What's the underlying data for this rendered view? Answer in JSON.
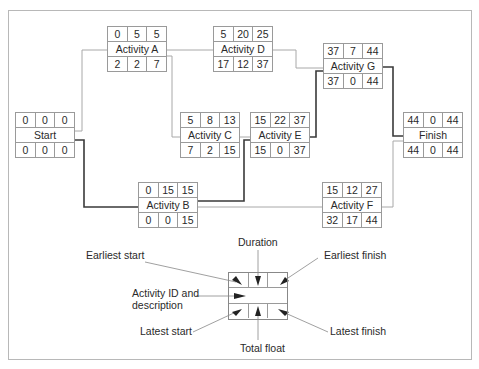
{
  "diagram": {
    "nodes": {
      "start": {
        "label": "Start",
        "es": "0",
        "dur": "0",
        "ef": "0",
        "ls": "0",
        "tf": "0",
        "lf": "0"
      },
      "activity_a": {
        "label": "Activity A",
        "es": "0",
        "dur": "5",
        "ef": "5",
        "ls": "2",
        "tf": "2",
        "lf": "7"
      },
      "activity_b": {
        "label": "Activity B",
        "es": "0",
        "dur": "15",
        "ef": "15",
        "ls": "0",
        "tf": "0",
        "lf": "15"
      },
      "activity_c": {
        "label": "Activity C",
        "es": "5",
        "dur": "8",
        "ef": "13",
        "ls": "7",
        "tf": "2",
        "lf": "15"
      },
      "activity_d": {
        "label": "Activity D",
        "es": "5",
        "dur": "20",
        "ef": "25",
        "ls": "17",
        "tf": "12",
        "lf": "37"
      },
      "activity_e": {
        "label": "Activity E",
        "es": "15",
        "dur": "22",
        "ef": "37",
        "ls": "15",
        "tf": "0",
        "lf": "37"
      },
      "activity_f": {
        "label": "Activity F",
        "es": "15",
        "dur": "12",
        "ef": "27",
        "ls": "32",
        "tf": "17",
        "lf": "44"
      },
      "activity_g": {
        "label": "Activity G",
        "es": "37",
        "dur": "7",
        "ef": "44",
        "ls": "37",
        "tf": "0",
        "lf": "44"
      },
      "finish": {
        "label": "Finish",
        "es": "44",
        "dur": "0",
        "ef": "44",
        "ls": "44",
        "tf": "0",
        "lf": "44"
      }
    },
    "edges": [
      {
        "from": "Start",
        "to": "Activity A",
        "critical": false
      },
      {
        "from": "Start",
        "to": "Activity B",
        "critical": true
      },
      {
        "from": "Activity A",
        "to": "Activity C",
        "critical": false
      },
      {
        "from": "Activity A",
        "to": "Activity D",
        "critical": false
      },
      {
        "from": "Activity C",
        "to": "Activity E",
        "critical": false
      },
      {
        "from": "Activity B",
        "to": "Activity E",
        "critical": true
      },
      {
        "from": "Activity B",
        "to": "Activity F",
        "critical": false
      },
      {
        "from": "Activity D",
        "to": "Activity G",
        "critical": false
      },
      {
        "from": "Activity E",
        "to": "Activity G",
        "critical": true
      },
      {
        "from": "Activity G",
        "to": "Finish",
        "critical": true
      },
      {
        "from": "Activity F",
        "to": "Finish",
        "critical": false
      }
    ],
    "critical_path": [
      "Start",
      "Activity B",
      "Activity E",
      "Activity G",
      "Finish"
    ],
    "legend": {
      "duration": "Duration",
      "earliest_start": "Earliest start",
      "earliest_finish": "Earliest finish",
      "activity_id_line1": "Activity ID and",
      "activity_id_line2": "description",
      "latest_start": "Latest start",
      "latest_finish": "Latest finish",
      "total_float": "Total float"
    },
    "colors": {
      "critical_line": "#3a3a3a",
      "normal_line": "#a8a8a8",
      "border": "#9a9a9a",
      "text": "#2a2a2a"
    }
  }
}
